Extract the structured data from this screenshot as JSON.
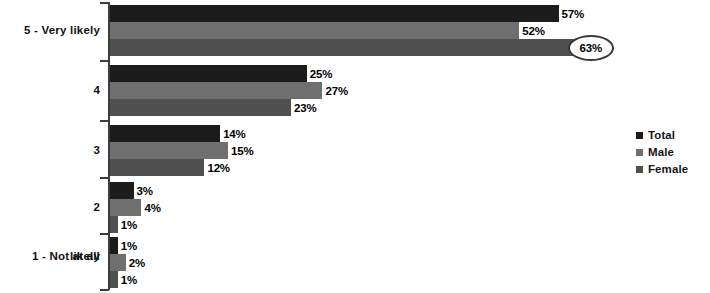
{
  "chart_data": {
    "type": "bar",
    "orientation": "horizontal",
    "title": "",
    "xlabel": "",
    "ylabel": "",
    "grid": false,
    "xlim": [
      0,
      70
    ],
    "legend_position": "right",
    "categories": [
      "5 - Very likely",
      "4",
      "3",
      "2",
      "1 - Not at all likely"
    ],
    "category_lines": [
      [
        "5 - Very likely"
      ],
      [
        "4"
      ],
      [
        "3"
      ],
      [
        "2"
      ],
      [
        "1 - Not at all",
        "likely"
      ]
    ],
    "series": [
      {
        "name": "Total",
        "color": "#1c1c1c",
        "values": [
          57,
          25,
          14,
          3,
          1
        ],
        "labels": [
          "57%",
          "25%",
          "14%",
          "3%",
          "1%"
        ]
      },
      {
        "name": "Male",
        "color": "#6f6f6f",
        "values": [
          52,
          27,
          15,
          4,
          2
        ],
        "labels": [
          "52%",
          "27%",
          "15%",
          "4%",
          "2%"
        ]
      },
      {
        "name": "Female",
        "color": "#505050",
        "values": [
          63,
          23,
          12,
          1,
          1
        ],
        "labels": [
          "63%",
          "23%",
          "12%",
          "1%",
          "1%"
        ]
      }
    ],
    "annotations": [
      {
        "type": "ellipse-callout",
        "series": "Female",
        "category": "5 - Very likely",
        "text": "63%",
        "outline_color": "#3a3a3a"
      }
    ]
  },
  "legend": {
    "items": [
      {
        "label": "Total",
        "color": "#1c1c1c"
      },
      {
        "label": "Male",
        "color": "#6f6f6f"
      },
      {
        "label": "Female",
        "color": "#505050"
      }
    ]
  },
  "colors": {
    "background": "#ffffff",
    "axis": "#3d3d3d",
    "text": "#111111",
    "total": "#1c1c1c",
    "male": "#6f6f6f",
    "female": "#505050",
    "callout_outline": "#3a3a3a"
  }
}
